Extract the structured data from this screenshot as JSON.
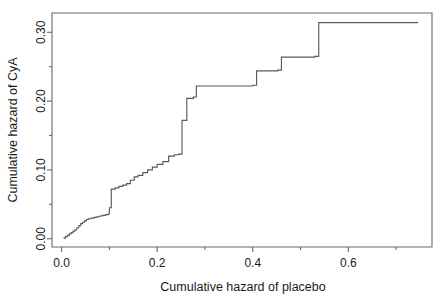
{
  "figure": {
    "background_color": "#ffffff",
    "line_color": "#5a5a5a",
    "axis_color": "#6b6b6b",
    "text_color": "#1a1a1a"
  },
  "chart_data": {
    "type": "line",
    "subtype": "step",
    "title": "",
    "xlabel": "Cumulative hazard of placebo",
    "ylabel": "Cumulative hazard of CyA",
    "xlim": [
      -0.02,
      0.775
    ],
    "ylim": [
      -0.012,
      0.328
    ],
    "xticks": [
      0.0,
      0.2,
      0.4,
      0.6
    ],
    "xtick_labels": [
      "0.0",
      "0.2",
      "0.4",
      "0.6"
    ],
    "yticks": [
      0.0,
      0.1,
      0.2,
      0.3
    ],
    "ytick_labels": [
      "0.00",
      "0.10",
      "0.20",
      "0.30"
    ],
    "xminor_ticks": [
      0.1,
      0.3,
      0.5,
      0.7
    ],
    "yminor_ticks": [
      0.05,
      0.15,
      0.25
    ],
    "grid": false,
    "legend": null,
    "series": [
      {
        "name": "Cumulative hazard CyA vs placebo",
        "x": [
          0.004,
          0.008,
          0.012,
          0.016,
          0.02,
          0.024,
          0.028,
          0.032,
          0.036,
          0.04,
          0.044,
          0.048,
          0.052,
          0.056,
          0.062,
          0.068,
          0.074,
          0.08,
          0.086,
          0.092,
          0.098,
          0.1,
          0.104,
          0.112,
          0.12,
          0.128,
          0.136,
          0.144,
          0.152,
          0.16,
          0.17,
          0.18,
          0.19,
          0.2,
          0.212,
          0.224,
          0.236,
          0.245,
          0.252,
          0.262,
          0.276,
          0.282,
          0.4,
          0.408,
          0.452,
          0.46,
          0.53,
          0.538,
          0.745
        ],
        "y": [
          0.001,
          0.003,
          0.005,
          0.007,
          0.009,
          0.011,
          0.013,
          0.016,
          0.019,
          0.022,
          0.024,
          0.026,
          0.028,
          0.029,
          0.03,
          0.031,
          0.032,
          0.033,
          0.034,
          0.035,
          0.036,
          0.045,
          0.072,
          0.074,
          0.076,
          0.078,
          0.08,
          0.085,
          0.09,
          0.092,
          0.096,
          0.1,
          0.104,
          0.108,
          0.112,
          0.12,
          0.122,
          0.123,
          0.172,
          0.204,
          0.206,
          0.222,
          0.223,
          0.244,
          0.245,
          0.264,
          0.265,
          0.314,
          0.315
        ]
      }
    ]
  }
}
